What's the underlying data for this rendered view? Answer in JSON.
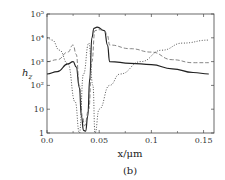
{
  "chart_data": {
    "type": "line",
    "title": "",
    "panel_label": "(b)",
    "xlabel": "x/μm",
    "ylabel": "h_z",
    "yscale": "log",
    "xlim": [
      0.0,
      0.16
    ],
    "ylim": [
      1,
      100000
    ],
    "grid": false,
    "legend": null,
    "x_ticks": [
      {
        "value": 0.0,
        "label": "0.0"
      },
      {
        "value": 0.05,
        "label": "0.05"
      },
      {
        "value": 0.1,
        "label": "0.1"
      },
      {
        "value": 0.15,
        "label": "0.15"
      }
    ],
    "y_ticks": [
      {
        "value": 1,
        "label": "1"
      },
      {
        "value": 10,
        "label": "10"
      },
      {
        "value": 100,
        "label": "10²"
      },
      {
        "value": 1000,
        "label": "10³"
      },
      {
        "value": 10000,
        "label": "10⁴"
      },
      {
        "value": 100000,
        "label": "10⁵"
      }
    ],
    "series": [
      {
        "name": "solid",
        "style": "solid",
        "x": [
          0.0,
          0.01,
          0.02,
          0.025,
          0.028,
          0.031,
          0.033,
          0.035,
          0.037,
          0.039,
          0.041,
          0.043,
          0.045,
          0.048,
          0.055,
          0.058,
          0.06,
          0.08,
          0.1,
          0.12,
          0.14,
          0.155
        ],
        "y": [
          300,
          380,
          800,
          1000,
          600,
          80,
          5,
          1.3,
          1.2,
          5,
          200,
          10000,
          25000,
          28000,
          20000,
          5000,
          1000,
          850,
          750,
          500,
          350,
          300
        ]
      },
      {
        "name": "dashed",
        "style": "dashed",
        "x": [
          0.0,
          0.01,
          0.02,
          0.025,
          0.028,
          0.031,
          0.034,
          0.036,
          0.04,
          0.043,
          0.046,
          0.05,
          0.055,
          0.058,
          0.06,
          0.08,
          0.1,
          0.12,
          0.14,
          0.155
        ],
        "y": [
          1000,
          1200,
          2500,
          5000,
          2000,
          100,
          5,
          2,
          10,
          1000,
          20000,
          22000,
          20000,
          12000,
          5000,
          3500,
          2500,
          1200,
          900,
          900
        ]
      },
      {
        "name": "dotted",
        "style": "dotted",
        "x": [
          0.0,
          0.005,
          0.012,
          0.02,
          0.027,
          0.031,
          0.035,
          0.04,
          0.044,
          0.046,
          0.05,
          0.06,
          0.07,
          0.09,
          0.11,
          0.13,
          0.155
        ],
        "y": [
          10000,
          8000,
          3000,
          800,
          20,
          1,
          300,
          6000,
          100,
          1,
          10,
          100,
          300,
          1000,
          3000,
          6000,
          8000
        ]
      }
    ]
  }
}
